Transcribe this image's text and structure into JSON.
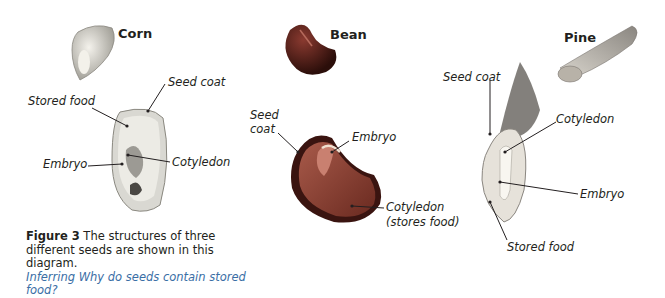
{
  "seeds": [
    {
      "name": "Corn",
      "labels": [
        "Seed coat",
        "Stored food",
        "Embryo",
        "Cotyledon"
      ]
    },
    {
      "name": "Bean",
      "labels": [
        "Seed coat",
        "Embryo",
        "Cotyledon",
        "(stores food)"
      ]
    },
    {
      "name": "Pine",
      "labels": [
        "Seed coat",
        "Cotyledon",
        "Embryo",
        "Stored food"
      ]
    }
  ],
  "caption": {
    "figure": "Figure 3",
    "text": " The structures of three different seeds are shown in this diagram.",
    "skill": "Inferring",
    "question": " Why do seeds contain stored food?"
  },
  "colors": {
    "skill_text": "#3a6ea5",
    "label_text": "#231f20"
  }
}
